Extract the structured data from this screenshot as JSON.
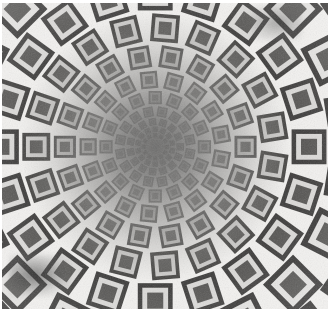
{
  "artwork": {
    "title": "Radial Nested-Square Tunnel Illusion",
    "medium": "grayscale op-art halftone print",
    "alt_text": "Concentric rings of nested square motifs shrinking toward a blurred gray center, creating a tunnel illusion",
    "canvas": {
      "page_width": 333,
      "page_height": 318,
      "plate_left": 2,
      "plate_top": 3,
      "plate_width": 326,
      "plate_height": 306,
      "margin_color": "#ffffff"
    }
  },
  "palette": {
    "paper_white": "#ffffff",
    "motif_light": "#f2f1ef",
    "motif_mid_light": "#c8c6c3",
    "motif_mid": "#8e8c89",
    "motif_dark": "#4a4947",
    "motif_deep": "#2e2d2c",
    "center_haze": "#7d7c7a",
    "smudge": "#2d2d2d"
  },
  "chart_data": {
    "type": "scatter",
    "xlabel": "",
    "ylabel": "",
    "grid": false,
    "legend": "none",
    "center": {
      "x": 0.47,
      "y": 0.47
    },
    "rings": 13,
    "sectors": 36,
    "ring_radii_pct": [
      2.6,
      3.9,
      5.6,
      7.9,
      11.0,
      15.0,
      20.2,
      26.6,
      34.4,
      43.6,
      54.2,
      66.2,
      79.6
    ],
    "ring_cell_scale": [
      0.018,
      0.024,
      0.032,
      0.043,
      0.057,
      0.074,
      0.095,
      0.12,
      0.15,
      0.183,
      0.22,
      0.258,
      0.296
    ],
    "ring_contrast": [
      0.06,
      0.1,
      0.16,
      0.24,
      0.34,
      0.46,
      0.58,
      0.7,
      0.8,
      0.88,
      0.94,
      0.98,
      1.0
    ],
    "growth_ratio": 1.27,
    "motif": {
      "name": "nested-square",
      "layers": 3,
      "outer_fill": "dark",
      "mid_fill": "light",
      "inner_fill": "dark",
      "inner_ratio": 0.46,
      "mid_ratio": 0.74
    },
    "rotation_rule": "element rotation equals polar angle; axis-aligned at 0/90/180/270 degrees, 45-degree diamond at diagonals",
    "annotations": [
      {
        "label": "blurred gray core",
        "x": 0.47,
        "y": 0.47
      },
      {
        "label": "dark smudge artifact",
        "x": 0.1,
        "y": 0.88
      },
      {
        "label": "corner smudge artifact",
        "x": 0.83,
        "y": 0.06
      }
    ]
  },
  "caption": {
    "text": ""
  }
}
